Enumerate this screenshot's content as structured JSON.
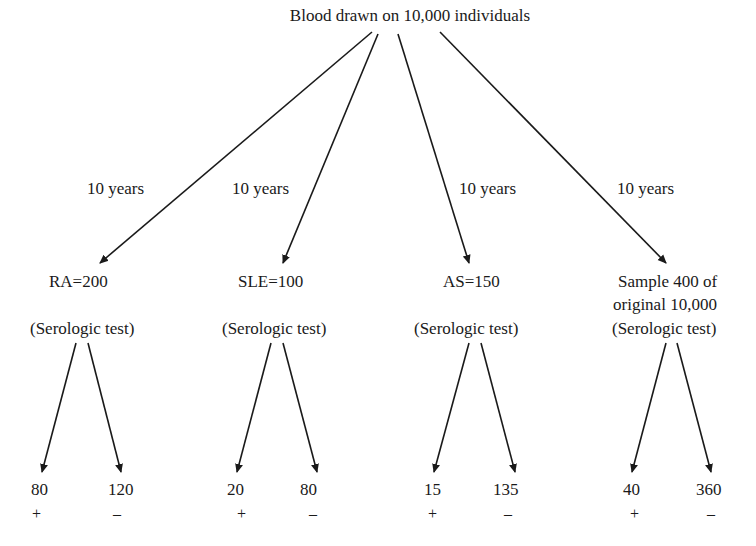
{
  "root": {
    "label": "Blood drawn on 10,000 individuals"
  },
  "branches": [
    {
      "interval": "10 years",
      "group": "RA=200",
      "test": "(Serologic test)",
      "results": [
        {
          "count": "80",
          "sign": "+"
        },
        {
          "count": "120",
          "sign": "–"
        }
      ]
    },
    {
      "interval": "10 years",
      "group": "SLE=100",
      "test": "(Serologic test)",
      "results": [
        {
          "count": "20",
          "sign": "+"
        },
        {
          "count": "80",
          "sign": "–"
        }
      ]
    },
    {
      "interval": "10 years",
      "group": "AS=150",
      "test": "(Serologic test)",
      "results": [
        {
          "count": "15",
          "sign": "+"
        },
        {
          "count": "135",
          "sign": "–"
        }
      ]
    },
    {
      "interval": "10 years",
      "group_line1": "Sample 400 of",
      "group_line2": "original 10,000",
      "test": "(Serologic test)",
      "results": [
        {
          "count": "40",
          "sign": "+"
        },
        {
          "count": "360",
          "sign": "–"
        }
      ]
    }
  ]
}
